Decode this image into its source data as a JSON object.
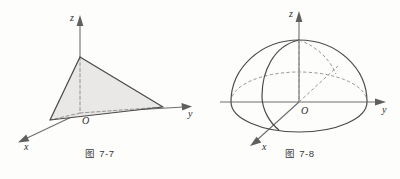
{
  "page": {
    "background_color": "#fdfdfc",
    "width": 400,
    "height": 179
  },
  "figures": [
    {
      "id": "figure-7-7",
      "caption": "图 7-7",
      "description": "tetrahedron-in-first-octant",
      "axes": {
        "z_label": "z",
        "y_label": "y",
        "x_label": "x",
        "origin_label": "O"
      },
      "colors": {
        "face_fill": "#e9e7e5",
        "solid_edge": "#4a4a4a",
        "hidden_edge": "#8c8c8c",
        "axis": "#6e6e6e"
      }
    },
    {
      "id": "figure-7-8",
      "caption": "图 7-8",
      "description": "upper-hemisphere-dome",
      "axes": {
        "z_label": "z",
        "y_label": "y",
        "x_label": "x",
        "origin_label": "O"
      },
      "colors": {
        "outline": "#4a4a4a",
        "hidden_curve": "#8a8a8a",
        "axis": "#6e6e6e"
      }
    }
  ]
}
